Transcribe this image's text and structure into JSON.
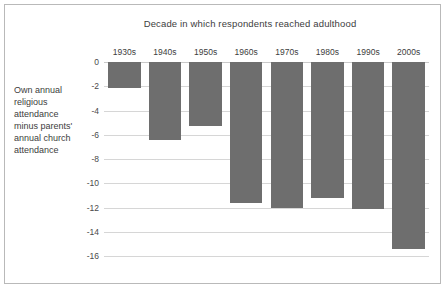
{
  "chart_data": {
    "type": "bar",
    "title": "Decade in which respondents reached adulthood",
    "xlabel": "",
    "ylabel": "Own annual religious attendance minus parents' annual church attendance",
    "ylabel_lines": [
      "Own annual",
      "religious",
      "attendance",
      "minus parents'",
      "annual church",
      "attendance"
    ],
    "categories": [
      "1930s",
      "1940s",
      "1950s",
      "1960s",
      "1970s",
      "1980s",
      "1990s",
      "2000s"
    ],
    "values": [
      -2.1,
      -6.4,
      -5.3,
      -11.6,
      -12.0,
      -11.2,
      -12.1,
      -15.4
    ],
    "ylim": [
      -16.8,
      0
    ],
    "yticks": [
      0,
      -2,
      -4,
      -6,
      -8,
      -10,
      -12,
      -14,
      -16
    ],
    "ytick_labels": [
      "0",
      "-2",
      "-4",
      "-6",
      "-8",
      "-10",
      "-12",
      "-14",
      "-16"
    ],
    "grid": true,
    "legend": false,
    "bar_color": "#6e6e6e",
    "gridline_color": "#d6d6d6",
    "frame_color": "#b9b9b9",
    "background": "#ffffff",
    "text_color": "#3d3d3d"
  }
}
